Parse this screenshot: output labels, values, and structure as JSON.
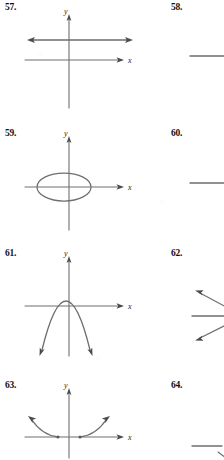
{
  "page": {
    "kind": "textbook-exercise-figures",
    "background_color": "#ffffff",
    "curve_color": "#6e6e6e",
    "axis_color": "#6e6e6e",
    "text_color": "#111111",
    "columns": 2,
    "note": "right column figures are cropped at the image edge"
  },
  "axis_labels": {
    "x": "x",
    "y": "y"
  },
  "problems": [
    {
      "number": "57.",
      "column": "left",
      "graph_type": "horizontal-line",
      "description": "horizontal line above the x-axis with arrowheads at both ends, drawn on x-y axes"
    },
    {
      "number": "58.",
      "column": "right",
      "graph_type": "horizontal-line",
      "description": "cropped figure; only a horizontal line segment is visible at the page edge"
    },
    {
      "number": "59.",
      "column": "left",
      "graph_type": "ellipse",
      "description": "horizontal ellipse centered just left of the origin, crossing the x-axis"
    },
    {
      "number": "60.",
      "column": "right",
      "graph_type": "horizontal-line",
      "description": "cropped figure; only a horizontal line segment is visible at the page edge"
    },
    {
      "number": "61.",
      "column": "left",
      "graph_type": "parabola-down",
      "description": "downward-opening parabola with vertex above the x-axis, arrowheads on both ends"
    },
    {
      "number": "62.",
      "column": "right",
      "graph_type": "two-rays",
      "description": "cropped figure; two slanted rays with arrowheads plus a horizontal line at the page edge"
    },
    {
      "number": "63.",
      "column": "left",
      "graph_type": "two-branches",
      "description": "two curved branches rising outward from two points on the x-axis, arrowheads at both outer ends"
    },
    {
      "number": "64.",
      "column": "right",
      "graph_type": "line",
      "description": "cropped figure; a horizontal line segment with a faint slanted mark at the page edge"
    }
  ]
}
